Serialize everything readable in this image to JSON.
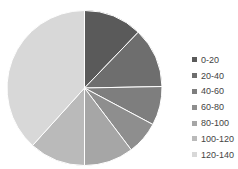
{
  "chart_data": {
    "type": "pie",
    "title": "",
    "categories": [
      "0-20",
      "20-40",
      "40-60",
      "60-80",
      "80-100",
      "100-120",
      "120-140"
    ],
    "values": [
      12.2,
      12.5,
      8.1,
      6.9,
      10.3,
      11.7,
      38.3
    ],
    "colors": [
      "#5a5a5a",
      "#6e6e6e",
      "#7e7e7e",
      "#8e8e8e",
      "#a6a6a6",
      "#bababa",
      "#d8d8d8"
    ],
    "legend_position": "right",
    "start_angle_deg": 0,
    "direction": "clockwise"
  },
  "legend": {
    "items": [
      {
        "label": "0-20"
      },
      {
        "label": "20-40"
      },
      {
        "label": "40-60"
      },
      {
        "label": "60-80"
      },
      {
        "label": "80-100"
      },
      {
        "label": "100-120"
      },
      {
        "label": "120-140"
      }
    ]
  }
}
